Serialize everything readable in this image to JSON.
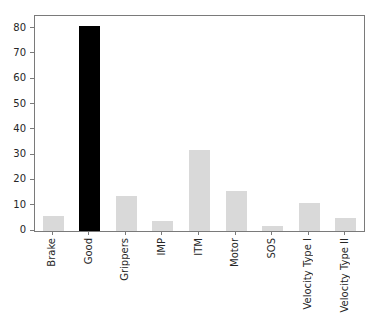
{
  "chart_data": {
    "type": "bar",
    "categories": [
      "Brake",
      "Good",
      "Grippers",
      "IMP",
      "ITM",
      "Motor",
      "SOS",
      "Velocity Type I",
      "Velocity Type II"
    ],
    "values": [
      6,
      81,
      14,
      4,
      32,
      16,
      2,
      11,
      5
    ],
    "highlight_category": "Good",
    "bar_color_default": "#d9d9d9",
    "bar_color_highlight": "#000000",
    "title": "",
    "xlabel": "",
    "ylabel": "",
    "ylim": [
      0,
      85
    ],
    "yticks": [
      0,
      10,
      20,
      30,
      40,
      50,
      60,
      70,
      80
    ],
    "x_tick_rotation": 90,
    "grid": false,
    "legend": null
  },
  "figure": {
    "background": "#ffffff",
    "spine_color": "#7a7a7a",
    "text_color": "#262626"
  }
}
